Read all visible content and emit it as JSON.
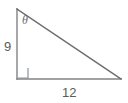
{
  "figure": {
    "type": "right-triangle-diagram",
    "background_color": "#ffffff",
    "stroke_color": "#808285",
    "text_color": "#5a5b5d",
    "labels": {
      "vertical_leg": "9",
      "horizontal_leg": "12",
      "angle": "θ"
    },
    "geometry": {
      "top_vertex": [
        17,
        9
      ],
      "right_angle_vertex": [
        17,
        79
      ],
      "right_vertex": [
        121,
        79
      ],
      "right_angle_marker_size": 10
    }
  }
}
